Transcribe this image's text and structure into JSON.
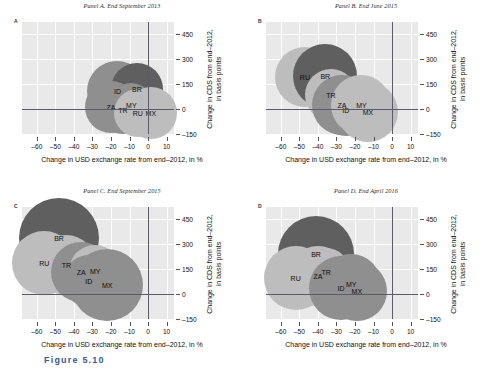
{
  "figure": {
    "caption": "Figure 5.10",
    "x_axis_title": "Change in USD exchange rate from end–2012, in %",
    "y_axis_title_line1": "Change in CDS from end–2012,",
    "y_axis_title_line2": "in basis points",
    "x_ticks": [
      "–60",
      "–50",
      "–40",
      "–30",
      "–20",
      "–10",
      "0",
      "10"
    ],
    "x_tick_values": [
      -60,
      -50,
      -40,
      -30,
      -20,
      -10,
      0,
      10
    ],
    "y_ticks": [
      "450",
      "300",
      "150",
      "0",
      "–150"
    ],
    "y_tick_values": [
      450,
      300,
      150,
      0,
      -150
    ],
    "colors": {
      "plot_background": "#e9e9e9",
      "gridline": "#ffffff",
      "axis": "#5a5a6b",
      "bubble_dark": "#5f5f5f",
      "bubble_medium": "#8f8f8f",
      "bubble_light": "#bdbdbd"
    }
  },
  "chart_data": {
    "type": "scatter",
    "xlabel": "Change in USD exchange rate from end–2012, in %",
    "ylabel": "Change in CDS from end–2012, in basis points",
    "xlim": [
      -68,
      14
    ],
    "ylim": [
      -150,
      520
    ],
    "grid": true,
    "legend": "none",
    "bubble_encoding": "bubble area; labels are ISO country codes",
    "panels": [
      {
        "letter": "A",
        "title": "Panel A. End September 2013",
        "points": [
          {
            "label": "ID",
            "x": -16.5,
            "y": 105,
            "r": 30,
            "shade": "medium"
          },
          {
            "label": "BR",
            "x": -6.0,
            "y": 120,
            "r": 26,
            "shade": "dark"
          },
          {
            "label": "ZA",
            "x": -20.0,
            "y": 10,
            "r": 26,
            "shade": "medium"
          },
          {
            "label": "TR",
            "x": -13.5,
            "y": -5,
            "r": 24,
            "shade": "medium"
          },
          {
            "label": "MY",
            "x": -9.0,
            "y": 22,
            "r": 22,
            "shade": "medium"
          },
          {
            "label": "RU",
            "x": -5.5,
            "y": -25,
            "r": 24,
            "shade": "light"
          },
          {
            "label": "MX",
            "x": 1.5,
            "y": -25,
            "r": 26,
            "shade": "light"
          }
        ]
      },
      {
        "letter": "B",
        "title": "Panel B. End June 2015",
        "points": [
          {
            "label": "RU",
            "x": -47.0,
            "y": 190,
            "r": 30,
            "shade": "light"
          },
          {
            "label": "BR",
            "x": -36.0,
            "y": 195,
            "r": 32,
            "shade": "dark"
          },
          {
            "label": "TR",
            "x": -33.0,
            "y": 85,
            "r": 26,
            "shade": "light"
          },
          {
            "label": "ZA",
            "x": -27.0,
            "y": 25,
            "r": 30,
            "shade": "medium"
          },
          {
            "label": "ID",
            "x": -25.0,
            "y": -5,
            "r": 26,
            "shade": "medium"
          },
          {
            "label": "MY",
            "x": -16.5,
            "y": 25,
            "r": 30,
            "shade": "light"
          },
          {
            "label": "MX",
            "x": -13.0,
            "y": -20,
            "r": 30,
            "shade": "light"
          }
        ]
      },
      {
        "letter": "C",
        "title": "Panel C. End September 2015",
        "points": [
          {
            "label": "BR",
            "x": -48.0,
            "y": 335,
            "r": 40,
            "shade": "dark"
          },
          {
            "label": "RU",
            "x": -56.0,
            "y": 185,
            "r": 32,
            "shade": "light"
          },
          {
            "label": "TR",
            "x": -44.0,
            "y": 175,
            "r": 30,
            "shade": "light"
          },
          {
            "label": "ZA",
            "x": -36.0,
            "y": 130,
            "r": 30,
            "shade": "medium"
          },
          {
            "label": "MY",
            "x": -28.5,
            "y": 135,
            "r": 26,
            "shade": "light"
          },
          {
            "label": "ID",
            "x": -32.0,
            "y": 75,
            "r": 26,
            "shade": "medium"
          },
          {
            "label": "MX",
            "x": -22.0,
            "y": 55,
            "r": 36,
            "shade": "medium"
          }
        ]
      },
      {
        "letter": "D",
        "title": "Panel D. End April 2016",
        "points": [
          {
            "label": "BR",
            "x": -41.0,
            "y": 240,
            "r": 38,
            "shade": "dark"
          },
          {
            "label": "RU",
            "x": -52.0,
            "y": 95,
            "r": 32,
            "shade": "light"
          },
          {
            "label": "ZA",
            "x": -40.0,
            "y": 110,
            "r": 30,
            "shade": "light"
          },
          {
            "label": "TR",
            "x": -35.5,
            "y": 130,
            "r": 24,
            "shade": "light"
          },
          {
            "label": "ID",
            "x": -27.5,
            "y": 35,
            "r": 32,
            "shade": "medium"
          },
          {
            "label": "MY",
            "x": -22.0,
            "y": 60,
            "r": 30,
            "shade": "medium"
          },
          {
            "label": "MX",
            "x": -19.0,
            "y": 15,
            "r": 30,
            "shade": "medium"
          }
        ]
      }
    ]
  }
}
